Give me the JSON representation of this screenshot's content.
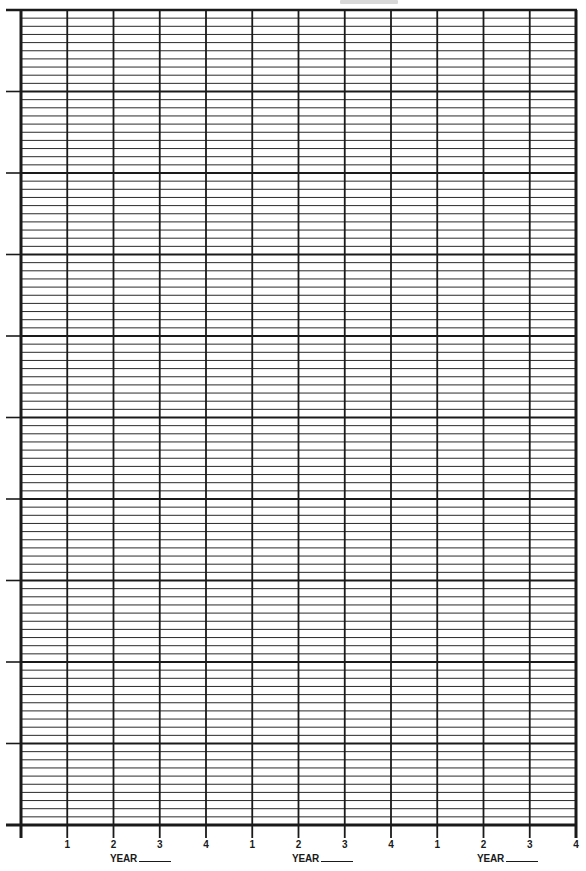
{
  "chart_data": {
    "type": "line",
    "title": "",
    "xlabel": "YEAR",
    "ylabel": "",
    "grid": true,
    "x_groups": [
      {
        "label": "YEAR",
        "blank": true,
        "quarters": [
          "1",
          "2",
          "3",
          "4"
        ]
      },
      {
        "label": "YEAR",
        "blank": true,
        "quarters": [
          "1",
          "2",
          "3",
          "4"
        ]
      },
      {
        "label": "YEAR",
        "blank": true,
        "quarters": [
          "1",
          "2",
          "3",
          "4"
        ]
      }
    ],
    "categories": [
      "1",
      "2",
      "3",
      "4",
      "1",
      "2",
      "3",
      "4",
      "1",
      "2",
      "3",
      "4"
    ],
    "x_columns": 12,
    "y_major_divisions": 10,
    "y_minor_per_major": 10,
    "y_tick_labels": [],
    "series": [],
    "legend": null
  },
  "layout": {
    "grid_left": 21,
    "grid_right": 576,
    "grid_top": 10,
    "grid_bottom": 825,
    "left_tick_x": 6,
    "bottom_tick_extend": 13,
    "line_color": "#1a1a1a",
    "minor_line_color": "#2a2a2a",
    "background": "#ffffff"
  },
  "axis": {
    "quarter_labels": [
      "1",
      "2",
      "3",
      "4",
      "1",
      "2",
      "3",
      "4",
      "1",
      "2",
      "3",
      "4"
    ],
    "year_labels": [
      "YEAR",
      "YEAR",
      "YEAR"
    ]
  }
}
